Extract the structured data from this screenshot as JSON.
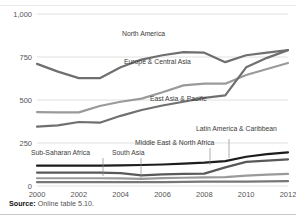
{
  "source": {
    "prefix": "Source:",
    "text": " Online table 5.10."
  },
  "chart_data": {
    "type": "line",
    "title": "",
    "subtitle": "",
    "xlabel": "",
    "ylabel": "",
    "grid": true,
    "legend_position": "inline-labels",
    "x": [
      2000,
      2001,
      2002,
      2003,
      2004,
      2005,
      2006,
      2007,
      2008,
      2009,
      2010,
      2011,
      2012
    ],
    "xticks": [
      "2000",
      "2002",
      "2004",
      "2006",
      "2008",
      "2010",
      "2012"
    ],
    "yticks": [
      "0",
      "250",
      "500",
      "750",
      "1,000"
    ],
    "ylim": [
      0,
      1000
    ],
    "xlim": [
      2000,
      2012
    ],
    "series": [
      {
        "name": "North America",
        "color": "#6f6f6f",
        "width": 2.2,
        "values": [
          710,
          665,
          627,
          627,
          690,
          735,
          760,
          778,
          775,
          720,
          760,
          775,
          790
        ]
      },
      {
        "name": "Europe & Central Asia",
        "color": "#9a9a9a",
        "width": 2.2,
        "values": [
          430,
          428,
          428,
          465,
          490,
          508,
          545,
          585,
          595,
          595,
          645,
          680,
          715
        ]
      },
      {
        "name": "East Asia & Pacific",
        "color": "#6f6f6f",
        "width": 2.2,
        "values": [
          345,
          352,
          372,
          368,
          408,
          442,
          468,
          490,
          512,
          527,
          690,
          745,
          790
        ]
      },
      {
        "name": "Latin America & Caribbean",
        "color": "#1c1c1c",
        "width": 2.2,
        "values": [
          118,
          118,
          118,
          118,
          120,
          122,
          125,
          130,
          136,
          145,
          170,
          185,
          195
        ]
      },
      {
        "name": "Middle East & North Africa",
        "color": "#595959",
        "width": 2.2,
        "values": [
          78,
          78,
          78,
          78,
          75,
          62,
          68,
          70,
          72,
          108,
          140,
          148,
          155
        ]
      },
      {
        "name": "South Asia",
        "color": "#9a9a9a",
        "width": 2.2,
        "values": [
          45,
          45,
          45,
          45,
          44,
          42,
          46,
          48,
          50,
          52,
          60,
          66,
          70
        ]
      },
      {
        "name": "Sub-Saharan Africa",
        "color": "#777777",
        "width": 2.2,
        "values": [
          22,
          22,
          22,
          22,
          22,
          22,
          23,
          24,
          25,
          25,
          26,
          27,
          28
        ]
      }
    ],
    "annotations": [
      {
        "label": "North America",
        "x": 122,
        "y": 36
      },
      {
        "label": "Europe & Central Asia",
        "x": 124,
        "y": 64
      },
      {
        "label": "East Asia & Pacific",
        "x": 150,
        "y": 101
      },
      {
        "label": "Latin America & Caribbean",
        "x": 196,
        "y": 131
      },
      {
        "label": "Middle East & North Africa",
        "x": 135,
        "y": 145
      },
      {
        "label": "South Asia",
        "x": 112,
        "y": 155
      },
      {
        "label": "Sub-Saharan Africa",
        "x": 31,
        "y": 155
      }
    ],
    "leader_lines": [
      {
        "for": "Sub-Saharan Africa",
        "x": 103,
        "y1": 158,
        "y2": 176
      },
      {
        "for": "South Asia",
        "x": 141,
        "y1": 158,
        "y2": 179
      },
      {
        "for": "Middle East & North Africa",
        "x": 210,
        "y1": 148,
        "y2": 165
      },
      {
        "for": "Latin America & Caribbean",
        "x": 229,
        "y1": 139,
        "y2": 158
      }
    ]
  }
}
